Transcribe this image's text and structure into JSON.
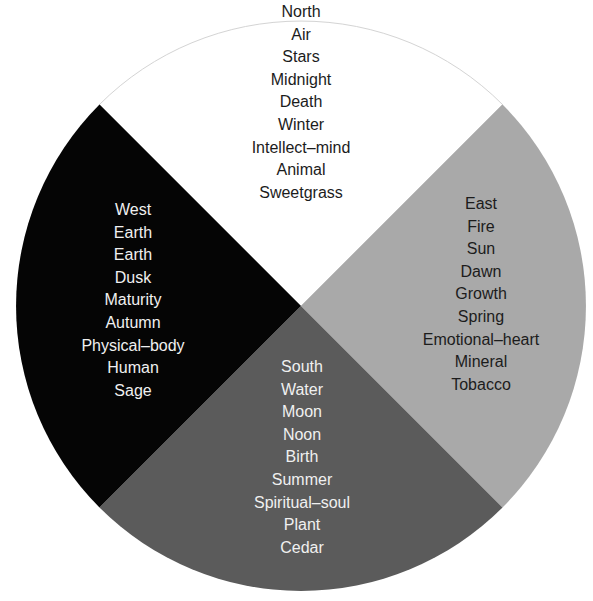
{
  "diagram": {
    "type": "medicine-wheel",
    "colors": {
      "north": "#ffffff",
      "east": "#a9a9a9",
      "south": "#5b5b5b",
      "west": "#050505",
      "outline": "#d0d0d0"
    },
    "quadrants": {
      "north": {
        "items": [
          "North",
          "Air",
          "Stars",
          "Midnight",
          "Death",
          "Winter",
          "Intellect–mind",
          "Animal",
          "Sweetgrass"
        ]
      },
      "east": {
        "items": [
          "East",
          "Fire",
          "Sun",
          "Dawn",
          "Growth",
          "Spring",
          "Emotional–heart",
          "Mineral",
          "Tobacco"
        ]
      },
      "south": {
        "items": [
          "South",
          "Water",
          "Moon",
          "Noon",
          "Birth",
          "Summer",
          "Spiritual–soul",
          "Plant",
          "Cedar"
        ]
      },
      "west": {
        "items": [
          "West",
          "Earth",
          "Earth",
          "Dusk",
          "Maturity",
          "Autumn",
          "Physical–body",
          "Human",
          "Sage"
        ]
      }
    }
  }
}
